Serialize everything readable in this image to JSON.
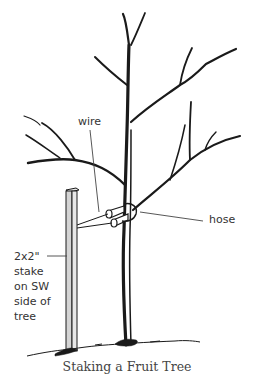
{
  "figure": {
    "caption": "Staking a Fruit Tree",
    "labels": {
      "wire": "wire",
      "hose": "hose",
      "stake_line1": "2x2\"",
      "stake_line2": "stake",
      "stake_line3": "on SW",
      "stake_line4": "side of",
      "stake_line5": "tree"
    },
    "colors": {
      "ink": "#1a1a1a",
      "stake_fill": "#d4d4d4",
      "text": "#333333"
    }
  }
}
